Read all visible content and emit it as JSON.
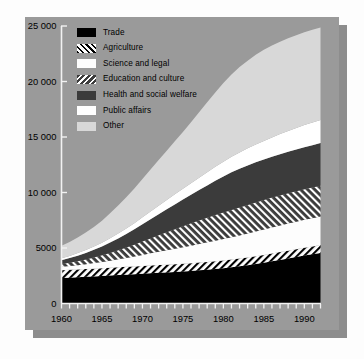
{
  "figure": {
    "panel_bg": "#9a9a9a",
    "shadow_color": "#8d8d8d",
    "page_bg": "#fdfdfd"
  },
  "legend": {
    "position": "inside-top-left",
    "items": [
      {
        "label": "Trade",
        "swatch": "sw-trade",
        "color": "#000000",
        "pattern": "solid-black"
      },
      {
        "label": "Agriculture",
        "swatch": "sw-agriculture",
        "color": "#ffffff",
        "pattern": "forward-diagonal-hatch-on-white"
      },
      {
        "label": "Science and legal",
        "swatch": "sw-science",
        "color": "#fdfdfd",
        "pattern": "solid-white"
      },
      {
        "label": "Education and culture",
        "swatch": "sw-education",
        "color": "#3b3b3b",
        "pattern": "back-diagonal-white-hatch-on-dark"
      },
      {
        "label": "Health and social welfare",
        "swatch": "sw-health",
        "color": "#3b3b3b",
        "pattern": "solid-dark-gray"
      },
      {
        "label": "Public affairs",
        "swatch": "sw-public",
        "color": "#ffffff",
        "pattern": "solid-white"
      },
      {
        "label": "Other",
        "swatch": "sw-other",
        "color": "#d8d8d8",
        "pattern": "solid-light-gray"
      }
    ]
  },
  "axes": {
    "y_ticks": [
      {
        "value": 0,
        "label": "0"
      },
      {
        "value": 5000,
        "label": "5000"
      },
      {
        "value": 10000,
        "label": "10 000"
      },
      {
        "value": 15000,
        "label": "15 000"
      },
      {
        "value": 20000,
        "label": "20 000"
      },
      {
        "value": 25000,
        "label": "25 000"
      }
    ],
    "x_ticks_major": [
      {
        "value": 1960,
        "label": "1960"
      },
      {
        "value": 1965,
        "label": "1965"
      },
      {
        "value": 1970,
        "label": "1970"
      },
      {
        "value": 1975,
        "label": "1975"
      },
      {
        "value": 1980,
        "label": "1980"
      },
      {
        "value": 1985,
        "label": "1985"
      },
      {
        "value": 1990,
        "label": "1990"
      }
    ],
    "x_minor_tick_interval": 1,
    "ylim": [
      0,
      25000
    ],
    "xlim": [
      1960,
      1992
    ],
    "grid": false,
    "xlabel": "",
    "ylabel": ""
  },
  "chart_data": {
    "type": "area",
    "stacked": true,
    "title": "",
    "subtitle": "",
    "xlabel": "",
    "ylabel": "",
    "xlim": [
      1960,
      1992
    ],
    "ylim": [
      0,
      25000
    ],
    "grid": false,
    "legend_position": "inside-top-left",
    "x": [
      1960,
      1961,
      1962,
      1963,
      1964,
      1965,
      1966,
      1967,
      1968,
      1969,
      1970,
      1971,
      1972,
      1973,
      1974,
      1975,
      1976,
      1977,
      1978,
      1979,
      1980,
      1981,
      1982,
      1983,
      1984,
      1985,
      1986,
      1987,
      1988,
      1989,
      1990,
      1991,
      1992
    ],
    "series": [
      {
        "name": "Trade",
        "color": "#000000",
        "pattern": "solid-black",
        "values": [
          2300,
          2330,
          2360,
          2400,
          2440,
          2480,
          2520,
          2560,
          2600,
          2640,
          2680,
          2720,
          2760,
          2800,
          2840,
          2880,
          2930,
          2990,
          3050,
          3110,
          3180,
          3260,
          3350,
          3450,
          3560,
          3680,
          3800,
          3930,
          4060,
          4190,
          4320,
          4440,
          4560
        ]
      },
      {
        "name": "Agriculture",
        "color": "#ffffff",
        "pattern": "forward-diagonal-hatch-on-white",
        "values": [
          700,
          700,
          700,
          700,
          700,
          700,
          700,
          700,
          700,
          700,
          700,
          700,
          700,
          700,
          700,
          700,
          700,
          700,
          700,
          700,
          700,
          700,
          700,
          700,
          700,
          700,
          700,
          700,
          700,
          700,
          700,
          700,
          700
        ]
      },
      {
        "name": "Science and legal",
        "color": "#fdfdfd",
        "pattern": "solid-white",
        "values": [
          300,
          340,
          390,
          440,
          500,
          560,
          640,
          720,
          810,
          900,
          1000,
          1100,
          1200,
          1300,
          1400,
          1490,
          1580,
          1670,
          1760,
          1850,
          1930,
          2010,
          2080,
          2150,
          2220,
          2280,
          2340,
          2390,
          2440,
          2480,
          2520,
          2550,
          2580
        ]
      },
      {
        "name": "Education and culture",
        "color": "#3b3b3b",
        "pattern": "back-diagonal-white-hatch-on-dark",
        "values": [
          250,
          300,
          360,
          430,
          510,
          600,
          700,
          810,
          930,
          1060,
          1200,
          1340,
          1480,
          1620,
          1760,
          1890,
          2010,
          2120,
          2220,
          2310,
          2390,
          2460,
          2520,
          2580,
          2630,
          2670,
          2700,
          2720,
          2730,
          2740,
          2750,
          2755,
          2760
        ]
      },
      {
        "name": "Health and social welfare",
        "color": "#3b3b3b",
        "pattern": "solid-dark-gray",
        "values": [
          350,
          420,
          500,
          590,
          690,
          800,
          930,
          1070,
          1220,
          1380,
          1550,
          1720,
          1890,
          2060,
          2230,
          2400,
          2570,
          2740,
          2910,
          3080,
          3250,
          3390,
          3490,
          3560,
          3610,
          3640,
          3670,
          3700,
          3730,
          3760,
          3790,
          3820,
          3850
        ]
      },
      {
        "name": "Public affairs",
        "color": "#ffffff",
        "pattern": "solid-white",
        "values": [
          180,
          200,
          230,
          260,
          300,
          340,
          390,
          440,
          500,
          560,
          630,
          700,
          770,
          840,
          910,
          980,
          1050,
          1120,
          1190,
          1260,
          1330,
          1400,
          1470,
          1540,
          1610,
          1680,
          1750,
          1820,
          1890,
          1950,
          2010,
          2050,
          2090
        ]
      },
      {
        "name": "Other",
        "color": "#d8d8d8",
        "pattern": "solid-light-gray",
        "values": [
          1120,
          1250,
          1400,
          1570,
          1760,
          1980,
          2240,
          2520,
          2820,
          3130,
          3460,
          3790,
          4120,
          4450,
          4780,
          5120,
          5500,
          5900,
          6300,
          6700,
          7090,
          7420,
          7690,
          7900,
          8070,
          8200,
          8280,
          8320,
          8340,
          8350,
          8350,
          8340,
          8330
        ]
      }
    ],
    "totals": [
      5200,
      5540,
      5940,
      6390,
      6900,
      7460,
      8120,
      8860,
      9580,
      10370,
      11220,
      12070,
      12920,
      13770,
      14620,
      15460,
      16340,
      17240,
      18130,
      19010,
      19870,
      20640,
      21300,
      21880,
      22400,
      22850,
      23240,
      23580,
      23850,
      24170,
      24440,
      24660,
      24870
    ]
  }
}
